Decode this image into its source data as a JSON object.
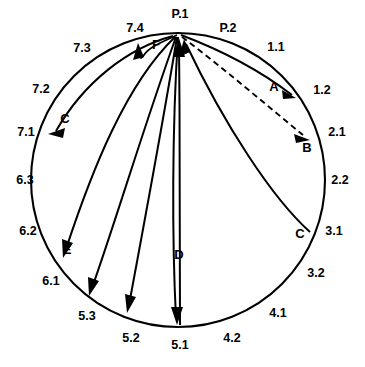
{
  "diagram": {
    "type": "circular-flow-diagram",
    "shape": "circle",
    "background_color": "#ffffff",
    "line_color": "#000000",
    "circle": {
      "cx": 178,
      "cy": 180,
      "r": 147
    },
    "apex_point": {
      "label": "P.1",
      "x": 180,
      "y": 33
    },
    "tick_labels": [
      {
        "id": "P1",
        "text": "P.1",
        "x": 180,
        "y": 18,
        "anchor": "middle",
        "position": "top"
      },
      {
        "id": "P2",
        "text": "P.2",
        "x": 228,
        "y": 32,
        "anchor": "middle",
        "position": "top-right"
      },
      {
        "id": "t11",
        "text": "1.1",
        "x": 276,
        "y": 51,
        "anchor": "middle",
        "position": "upper-right"
      },
      {
        "id": "t12",
        "text": "1.2",
        "x": 322,
        "y": 94,
        "anchor": "middle",
        "position": "right-upper"
      },
      {
        "id": "t21",
        "text": "2.1",
        "x": 337,
        "y": 136,
        "anchor": "middle",
        "position": "right"
      },
      {
        "id": "t22",
        "text": "2.2",
        "x": 340,
        "y": 184,
        "anchor": "middle",
        "position": "right"
      },
      {
        "id": "t31",
        "text": "3.1",
        "x": 334,
        "y": 235,
        "anchor": "middle",
        "position": "right-lower"
      },
      {
        "id": "t32",
        "text": "3.2",
        "x": 316,
        "y": 277,
        "anchor": "middle",
        "position": "lower-right"
      },
      {
        "id": "t41",
        "text": "4.1",
        "x": 278,
        "y": 317,
        "anchor": "middle",
        "position": "bottom-right"
      },
      {
        "id": "t42",
        "text": "4.2",
        "x": 232,
        "y": 342,
        "anchor": "middle",
        "position": "bottom-right"
      },
      {
        "id": "t51",
        "text": "5.1",
        "x": 180,
        "y": 349,
        "anchor": "middle",
        "position": "bottom"
      },
      {
        "id": "t52",
        "text": "5.2",
        "x": 131,
        "y": 342,
        "anchor": "middle",
        "position": "bottom-left"
      },
      {
        "id": "t53",
        "text": "5.3",
        "x": 87,
        "y": 320,
        "anchor": "middle",
        "position": "bottom-left"
      },
      {
        "id": "t61",
        "text": "6.1",
        "x": 51,
        "y": 285,
        "anchor": "middle",
        "position": "lower-left"
      },
      {
        "id": "t62",
        "text": "6.2",
        "x": 28,
        "y": 235,
        "anchor": "middle",
        "position": "left-lower"
      },
      {
        "id": "t63",
        "text": "6.3",
        "x": 25,
        "y": 184,
        "anchor": "middle",
        "position": "left"
      },
      {
        "id": "t71",
        "text": "7.1",
        "x": 26,
        "y": 136,
        "anchor": "middle",
        "position": "left-upper"
      },
      {
        "id": "t72",
        "text": "7.2",
        "x": 41,
        "y": 93,
        "anchor": "middle",
        "position": "upper-left"
      },
      {
        "id": "t73",
        "text": "7.3",
        "x": 82,
        "y": 52,
        "anchor": "middle",
        "position": "upper-left"
      },
      {
        "id": "t74",
        "text": "7.4",
        "x": 135,
        "y": 32,
        "anchor": "middle",
        "position": "top-left"
      }
    ],
    "flow_labels": [
      {
        "id": "A",
        "text": "A",
        "x": 274,
        "y": 91,
        "anchor": "middle"
      },
      {
        "id": "B",
        "text": "B",
        "x": 307,
        "y": 152,
        "anchor": "middle"
      },
      {
        "id": "C_right",
        "text": "C",
        "x": 300,
        "y": 238,
        "anchor": "middle"
      },
      {
        "id": "D",
        "text": "D",
        "x": 179,
        "y": 259,
        "anchor": "middle"
      },
      {
        "id": "E",
        "text": "E",
        "x": 67,
        "y": 254,
        "anchor": "middle"
      },
      {
        "id": "C_left",
        "text": "C",
        "x": 65,
        "y": 123,
        "anchor": "middle"
      },
      {
        "id": "F",
        "text": "F",
        "x": 156,
        "y": 49,
        "anchor": "middle"
      }
    ],
    "flows": [
      {
        "id": "A",
        "label": "A",
        "from": "P.1",
        "to": "1.2",
        "style": "solid",
        "direction": "outward",
        "arrow": "at-target"
      },
      {
        "id": "B",
        "label": "B",
        "from": "P.1",
        "to": "2.1",
        "style": "dashed",
        "direction": "outward",
        "arrow": "at-target"
      },
      {
        "id": "C_right",
        "label": "C",
        "from": "3.1",
        "to": "P.1",
        "style": "solid",
        "direction": "inward",
        "arrow": "at-apex"
      },
      {
        "id": "D",
        "label": "D",
        "from": "P.1",
        "to": "5.1",
        "style": "solid",
        "direction": "outward",
        "arrow": "at-target"
      },
      {
        "id": "D2",
        "label": "",
        "from": "P.1",
        "to": "5.2",
        "style": "solid",
        "direction": "outward",
        "arrow": "at-target"
      },
      {
        "id": "E",
        "label": "E",
        "from": "P.1",
        "to": "6.1",
        "style": "solid",
        "direction": "outward",
        "arrow": "at-target"
      },
      {
        "id": "E2",
        "label": "",
        "from": "P.1",
        "to": "5.3",
        "style": "solid",
        "direction": "outward",
        "arrow": "at-target"
      },
      {
        "id": "C_left",
        "label": "C",
        "from": "P.1",
        "to": "7.1",
        "style": "solid",
        "direction": "outward",
        "arrow": "at-target"
      },
      {
        "id": "F",
        "label": "F",
        "from": "P.1",
        "to": "P.1",
        "style": "solid",
        "direction": "loop",
        "arrow": "at-target"
      },
      {
        "id": "I1",
        "label": "",
        "from": "5.1",
        "to": "P.1",
        "style": "solid",
        "direction": "inward",
        "arrow": "at-apex"
      }
    ]
  }
}
